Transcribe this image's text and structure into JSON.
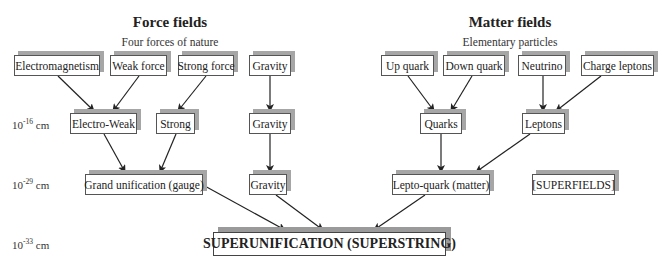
{
  "headings": {
    "force": {
      "title": "Force fields",
      "subtitle": "Four forces of nature"
    },
    "matter": {
      "title": "Matter fields",
      "subtitle": "Elementary particles"
    }
  },
  "scales": [
    {
      "base": "10",
      "exp": "-16",
      "unit": "cm"
    },
    {
      "base": "10",
      "exp": "-29",
      "unit": "cm"
    },
    {
      "base": "10",
      "exp": "-33",
      "unit": "cm"
    }
  ],
  "nodes": {
    "electromagnetism": "Electromagnetism",
    "weak_force": "Weak force",
    "strong_force": "Strong force",
    "gravity1": "Gravity",
    "up_quark": "Up quark",
    "down_quark": "Down quark",
    "neutrino": "Neutrino",
    "charge_leptons": "Charge leptons",
    "electro_weak": "Electro-Weak",
    "strong": "Strong",
    "gravity2": "Gravity",
    "quarks": "Quarks",
    "leptons": "Leptons",
    "grand_unification": "Grand unification (gauge)",
    "gravity3": "Gravity",
    "lepto_quark": "Lepto-quark (matter)",
    "superfields": "[SUPERFIELDS]",
    "superunification": "SUPERUNIFICATION (SUPERSTRING)"
  },
  "edges": [
    [
      "electromagnetism",
      "electro_weak"
    ],
    [
      "weak_force",
      "electro_weak"
    ],
    [
      "strong_force",
      "strong"
    ],
    [
      "gravity1",
      "gravity2"
    ],
    [
      "up_quark",
      "quarks"
    ],
    [
      "down_quark",
      "quarks"
    ],
    [
      "neutrino",
      "leptons"
    ],
    [
      "charge_leptons",
      "leptons"
    ],
    [
      "electro_weak",
      "grand_unification"
    ],
    [
      "strong",
      "grand_unification"
    ],
    [
      "gravity2",
      "gravity3"
    ],
    [
      "quarks",
      "lepto_quark"
    ],
    [
      "leptons",
      "lepto_quark"
    ],
    [
      "grand_unification",
      "superunification"
    ],
    [
      "gravity3",
      "superunification"
    ],
    [
      "lepto_quark",
      "superunification"
    ]
  ]
}
